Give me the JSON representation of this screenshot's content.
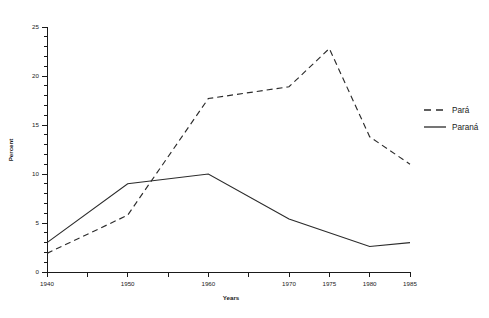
{
  "chart_data": {
    "type": "line",
    "title": "",
    "xlabel": "Years",
    "ylabel": "Percent",
    "x": [
      1940,
      1950,
      1960,
      1970,
      1975,
      1980,
      1985
    ],
    "xlim": [
      1940,
      1985
    ],
    "ylim": [
      0,
      25
    ],
    "grid": false,
    "legend_position": "right",
    "xticks_major": [
      1940,
      1945,
      1950,
      1955,
      1960,
      1965,
      1970,
      1975,
      1980,
      1985
    ],
    "xtick_labels": [
      "1940",
      "",
      "1950",
      "",
      "1960",
      "",
      "1970",
      "1975",
      "1980",
      "1985"
    ],
    "yticks_major": [
      0,
      5,
      10,
      15,
      20,
      25
    ],
    "ytick_labels": [
      "0",
      "5",
      "10",
      "15",
      "20",
      "25"
    ],
    "ytick_minor_step": 1,
    "series": [
      {
        "name": "Pará",
        "style": "dashed",
        "color": "#2b2b2b",
        "x": [
          1940,
          1950,
          1960,
          1970,
          1975,
          1980,
          1985
        ],
        "values": [
          1.9,
          5.8,
          17.7,
          18.9,
          22.8,
          13.8,
          11.0
        ]
      },
      {
        "name": "Paraná",
        "style": "solid",
        "color": "#2b2b2b",
        "x": [
          1940,
          1950,
          1960,
          1970,
          1980,
          1985
        ],
        "values": [
          3.0,
          9.0,
          10.0,
          5.4,
          2.6,
          3.0
        ]
      }
    ]
  },
  "axes": {
    "y_title": "Percent",
    "x_title": "Years"
  },
  "legend": {
    "entries": [
      {
        "label": "Pará",
        "style": "dashed"
      },
      {
        "label": "Paraná",
        "style": "solid"
      }
    ]
  }
}
